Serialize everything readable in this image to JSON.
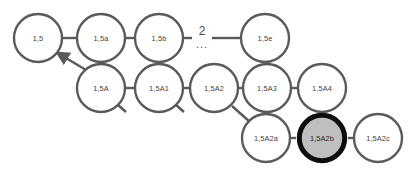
{
  "diagram": {
    "style": {
      "background_color": "#ffffff",
      "node_stroke_color": "#5a5a5a",
      "node_fill_color": "#ffffff",
      "node_text_color": "#3f3f3f",
      "edge_color": "#5a5a5a",
      "highlight_stroke_color": "#0d0d0d",
      "highlight_fill_color": "#bfbfbf",
      "node_radius": 24,
      "node_stroke_width": 2.4,
      "highlight_stroke_width": 5
    },
    "rows": [
      {
        "name": "row-top",
        "nodes": [
          {
            "id": "n-1-5",
            "label": "1,5",
            "cx": 38,
            "cy": 38,
            "highlighted": false
          },
          {
            "id": "n-1-5a",
            "label": "1,5a",
            "cx": 101,
            "cy": 38,
            "highlighted": false
          },
          {
            "id": "n-1-5b",
            "label": "1,5b",
            "cx": 159,
            "cy": 38,
            "highlighted": false
          },
          {
            "id": "n-1-5e",
            "label": "1,5e",
            "cx": 265,
            "cy": 38,
            "highlighted": false
          }
        ]
      },
      {
        "name": "row-middle",
        "nodes": [
          {
            "id": "n-1-5A",
            "label": "1,5A",
            "cx": 101,
            "cy": 88,
            "highlighted": false
          },
          {
            "id": "n-1-5A1",
            "label": "1,5A1",
            "cx": 159,
            "cy": 88,
            "highlighted": false
          },
          {
            "id": "n-1-5A2",
            "label": "1,5A2",
            "cx": 214,
            "cy": 88,
            "highlighted": false
          },
          {
            "id": "n-1-5A3",
            "label": "1,5A3",
            "cx": 267,
            "cy": 88,
            "highlighted": false
          },
          {
            "id": "n-1-5A4",
            "label": "1,5A4",
            "cx": 322,
            "cy": 88,
            "highlighted": false
          }
        ]
      },
      {
        "name": "row-bottom",
        "nodes": [
          {
            "id": "n-1-5A2a",
            "label": "1,5A2a",
            "cx": 266,
            "cy": 138,
            "highlighted": false
          },
          {
            "id": "n-1-5A2b",
            "label": "1,5A2b",
            "cx": 322,
            "cy": 138,
            "highlighted": true
          },
          {
            "id": "n-1-5A2c",
            "label": "1,5A2c",
            "cx": 378,
            "cy": 138,
            "highlighted": false
          }
        ]
      }
    ],
    "gap_marker": {
      "name": "ellipsis-gap",
      "number": "2",
      "dots": "...",
      "number_x": 202,
      "number_y": 31,
      "dots_x": 202,
      "dots_y": 44
    },
    "edges": [
      {
        "name": "edge-1-5--1-5a",
        "x1": 62,
        "y1": 38,
        "x2": 77,
        "y2": 38
      },
      {
        "name": "edge-1-5a--1-5b",
        "x1": 125,
        "y1": 38,
        "x2": 135,
        "y2": 38
      },
      {
        "name": "edge-1-5b--gap",
        "x1": 183,
        "y1": 38,
        "x2": 192,
        "y2": 38
      },
      {
        "name": "edge-gap--1-5e",
        "x1": 212,
        "y1": 38,
        "x2": 241,
        "y2": 38
      },
      {
        "name": "edge-1-5A--1-5A1",
        "x1": 125,
        "y1": 88,
        "x2": 135,
        "y2": 88
      },
      {
        "name": "edge-1-5A1--1-5A2",
        "x1": 183,
        "y1": 88,
        "x2": 190,
        "y2": 88
      },
      {
        "name": "edge-1-5A2--1-5A3",
        "x1": 238,
        "y1": 88,
        "x2": 243,
        "y2": 88
      },
      {
        "name": "edge-1-5A3--1-5A4",
        "x1": 291,
        "y1": 88,
        "x2": 298,
        "y2": 88
      },
      {
        "name": "edge-1-5A2a--1-5A2b",
        "x1": 290,
        "y1": 138,
        "x2": 296,
        "y2": 138
      },
      {
        "name": "edge-1-5A2b--1-5A2c",
        "x1": 348,
        "y1": 138,
        "x2": 354,
        "y2": 138
      },
      {
        "name": "edge-1-5A2--1-5A2a",
        "x1": 232,
        "y1": 106,
        "x2": 250,
        "y2": 122
      }
    ],
    "arrow_edge": {
      "name": "edge-1-5A--1-5-arrow",
      "x1": 86,
      "y1": 70,
      "x2": 56,
      "y2": 52
    },
    "stub_edges": [
      {
        "name": "stub-1-5A",
        "x1": 117,
        "y1": 104,
        "x2": 126,
        "y2": 112
      },
      {
        "name": "stub-1-5A1",
        "x1": 175,
        "y1": 104,
        "x2": 184,
        "y2": 112
      }
    ]
  }
}
